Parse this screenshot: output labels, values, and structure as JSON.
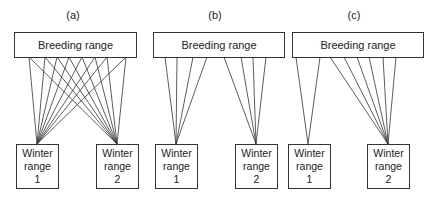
{
  "panels": [
    {
      "label": "(a)",
      "breeding_label": "Breeding range",
      "winter": [
        {
          "line1": "Winter",
          "line2": "range",
          "line3": "1"
        },
        {
          "line1": "Winter",
          "line2": "range",
          "line3": "2"
        }
      ],
      "connections": "each of 8 breeding sites connects to both winter ranges"
    },
    {
      "label": "(b)",
      "breeding_label": "Breeding range",
      "winter": [
        {
          "line1": "Winter",
          "line2": "range",
          "line3": "1"
        },
        {
          "line1": "Winter",
          "line2": "range",
          "line3": "2"
        }
      ],
      "connections": "4 breeding sites to winter range 1, 4 breeding sites to winter range 2"
    },
    {
      "label": "(c)",
      "breeding_label": "Breeding range",
      "winter": [
        {
          "line1": "Winter",
          "line2": "range",
          "line3": "1"
        },
        {
          "line1": "Winter",
          "line2": "range",
          "line3": "2"
        }
      ],
      "connections": "2 breeding sites to winter range 1, 6 breeding sites to winter range 2"
    }
  ],
  "style": {
    "line_color": "#333333",
    "box_border": "#333333"
  }
}
